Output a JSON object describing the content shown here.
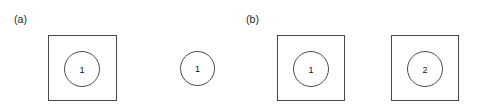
{
  "figure": {
    "background_color": "#ffffff",
    "stroke_color": "#4a4a4a",
    "text_color": "#1a1a1a",
    "width": 483,
    "height": 111
  },
  "panels": [
    {
      "label": "(a)",
      "label_x": 14,
      "label_y": 14
    },
    {
      "label": "(b)",
      "label_x": 246,
      "label_y": 14
    }
  ],
  "items": [
    {
      "name": "square-with-circle-1",
      "panel": "(a)",
      "has_square": true,
      "square": {
        "x": 48,
        "y": 35,
        "w": 69,
        "h": 66
      },
      "circle": {
        "x": 64,
        "y": 51,
        "d": 36
      },
      "circle_label": "1"
    },
    {
      "name": "standalone-circle-1",
      "panel": "(a)",
      "has_square": false,
      "circle": {
        "x": 180,
        "y": 51,
        "d": 35
      },
      "circle_label": "1"
    },
    {
      "name": "square-with-circle-2",
      "panel": "(b)",
      "has_square": true,
      "square": {
        "x": 277,
        "y": 35,
        "w": 68,
        "h": 66
      },
      "circle": {
        "x": 293,
        "y": 51,
        "d": 36
      },
      "circle_label": "1"
    },
    {
      "name": "square-with-circle-3",
      "panel": "(b)",
      "has_square": true,
      "square": {
        "x": 391,
        "y": 35,
        "w": 68,
        "h": 66
      },
      "circle": {
        "x": 407,
        "y": 51,
        "d": 36
      },
      "circle_label": "2"
    }
  ]
}
